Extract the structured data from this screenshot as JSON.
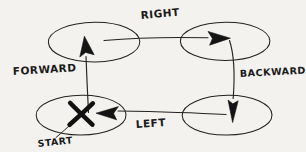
{
  "diagram": {
    "style": "hand-drawn pencil sketch on paper",
    "background_color": "#f4f2ef",
    "ink_color": "#1f1f1f",
    "labels": {
      "forward": "FORWARD",
      "right": "RIGHT",
      "backward": "BACKWARD",
      "left": "LEFT",
      "start": "START",
      "start_marker": "X"
    },
    "nodes": [
      {
        "id": "top-left",
        "name": "ellipse-top-left",
        "cx": 94,
        "cy": 42,
        "rx": 46,
        "ry": 20,
        "contains": "forward-arrowhead"
      },
      {
        "id": "top-right",
        "name": "ellipse-top-right",
        "cx": 225,
        "cy": 41,
        "rx": 45,
        "ry": 19,
        "contains": "right-arrowhead"
      },
      {
        "id": "bottom-right",
        "name": "ellipse-bottom-right",
        "cx": 227,
        "cy": 115,
        "rx": 45,
        "ry": 20,
        "contains": "backward-arrowhead"
      },
      {
        "id": "bottom-left",
        "name": "ellipse-bottom-left",
        "cx": 81,
        "cy": 115,
        "rx": 45,
        "ry": 20,
        "contains": "start-x-marker and left-arrowhead"
      }
    ],
    "edges": [
      {
        "id": "forward",
        "label": "FORWARD",
        "from": "bottom-left",
        "to": "top-left",
        "direction": "up",
        "arrowhead": "up-tilted-left"
      },
      {
        "id": "right",
        "label": "RIGHT",
        "from": "top-left",
        "to": "top-right",
        "direction": "right",
        "arrowhead": "right"
      },
      {
        "id": "backward",
        "label": "BACKWARD",
        "from": "top-right",
        "to": "bottom-right",
        "direction": "down",
        "arrowhead": "down"
      },
      {
        "id": "left",
        "label": "LEFT",
        "from": "bottom-right",
        "to": "bottom-left",
        "direction": "left",
        "arrowhead": "left"
      }
    ],
    "annotations": [
      {
        "id": "start",
        "label": "START",
        "points_to": "start-x-marker",
        "x": 40,
        "y": 144
      }
    ],
    "label_positions": {
      "forward": {
        "x": 13,
        "y": 75
      },
      "right": {
        "x": 141,
        "y": 19
      },
      "backward": {
        "x": 240,
        "y": 76
      },
      "left": {
        "x": 136,
        "y": 127
      },
      "start": {
        "x": 40,
        "y": 146
      }
    }
  }
}
